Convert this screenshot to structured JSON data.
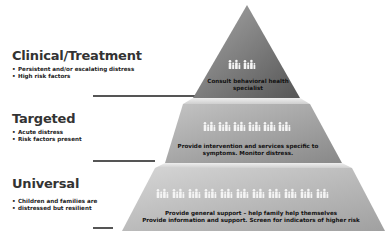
{
  "tiers": [
    {
      "id": "clinical",
      "title": "Clinical/Treatment",
      "bullets": [
        "Persistent and/or escalating distress",
        "High risk factors"
      ],
      "pyramid_text": [
        "Consult behavioral health",
        "specialist"
      ],
      "family_icon_groups": 2,
      "color_top": "#9a9a9a",
      "color_bottom": "#5e5e5e"
    },
    {
      "id": "targeted",
      "title": "Targeted",
      "bullets": [
        "Acute distress",
        "Risk factors present"
      ],
      "pyramid_text": [
        "Provide intervention and services specific to",
        "symptoms. Monitor distress."
      ],
      "family_icon_groups": 4,
      "color_top": "#bdbdbd",
      "color_bottom": "#8c8c8c"
    },
    {
      "id": "universal",
      "title": "Universal",
      "bullets": [
        "Children and families are",
        "distressed but resilient"
      ],
      "pyramid_text": [
        "Provide general support – help family help themselves",
        "Provide information and support. Screen for indicators of higher risk"
      ],
      "family_icon_groups": 7,
      "color_top": "#d2d2d2",
      "color_bottom": "#a8a8a8"
    }
  ],
  "colors": {
    "background": "#ffffff",
    "separator": "#555555",
    "title_text": "#333333",
    "icon_fill": "#f2f2f2"
  }
}
